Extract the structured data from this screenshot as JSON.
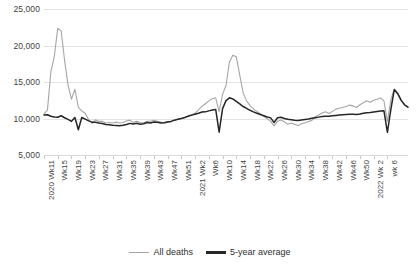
{
  "chart_data": {
    "type": "line",
    "title": "",
    "xlabel": "",
    "ylabel": "",
    "ylim": [
      5000,
      25000
    ],
    "y_ticks": [
      5000,
      10000,
      15000,
      20000,
      25000
    ],
    "y_tick_labels": [
      "5,000",
      "10,000",
      "15,000",
      "20,000",
      "25,000"
    ],
    "grid": true,
    "legend_position": "bottom-center",
    "legend": [
      "All deaths",
      "5-year average"
    ],
    "colors": {
      "all_deaths": "#a6a6a6",
      "five_year_average": "#262626",
      "gridline": "#e4e4e4"
    },
    "x_tick_labels": [
      "2020 Wk11",
      "Wk15",
      "Wk19",
      "Wk23",
      "Wk27",
      "Wk31",
      "Wk35",
      "Wk39",
      "Wk43",
      "Wk47",
      "Wk51",
      "2021 Wk2",
      "Wk6",
      "Wk10",
      "Wk14",
      "Wk18",
      "Wk22",
      "Wk26",
      "Wk30",
      "Wk34",
      "Wk38",
      "Wk42",
      "Wk46",
      "Wk50",
      "2022 Wk 2",
      "wk 6"
    ],
    "x_tick_every": 4,
    "series": [
      {
        "name": "All deaths",
        "values": [
          10645,
          11141,
          16387,
          18516,
          22351,
          21997,
          17953,
          14573,
          12657,
          14014,
          11539,
          11037,
          10709,
          9824,
          9339,
          9824,
          9602,
          9631,
          9392,
          9451,
          9392,
          9500,
          9392,
          9459,
          9655,
          9780,
          9451,
          9631,
          9451,
          9392,
          9631,
          9631,
          9772,
          9631,
          9514,
          9392,
          9574,
          9574,
          9788,
          9902,
          10012,
          10139,
          10389,
          10552,
          10718,
          11194,
          11683,
          12020,
          12416,
          12717,
          12832,
          10942,
          13300,
          14520,
          17751,
          18676,
          18447,
          15948,
          13508,
          12417,
          11765,
          11311,
          10982,
          10638,
          10290,
          9951,
          9610,
          8995,
          9612,
          9803,
          9542,
          9220,
          9372,
          9195,
          9046,
          9274,
          9410,
          9581,
          9744,
          10250,
          10490,
          10742,
          10920,
          10686,
          10978,
          11281,
          11406,
          11512,
          11641,
          11836,
          11729,
          11509,
          11887,
          12159,
          12437,
          12222,
          12493,
          12650,
          12828,
          12414,
          9600,
          12550,
          14057,
          13540,
          12554,
          11870,
          11480
        ]
      },
      {
        "name": "5-year average",
        "values": [
          10465,
          10520,
          10305,
          10195,
          10173,
          10380,
          10101,
          9884,
          9608,
          10145,
          8460,
          10132,
          9905,
          9672,
          9501,
          9474,
          9380,
          9320,
          9188,
          9135,
          9079,
          9049,
          9020,
          9061,
          9186,
          9332,
          9236,
          9353,
          9222,
          9284,
          9450,
          9394,
          9528,
          9492,
          9392,
          9411,
          9530,
          9601,
          9773,
          9893,
          10003,
          10131,
          10319,
          10462,
          10592,
          10716,
          10896,
          10908,
          11046,
          11156,
          11247,
          8123,
          11350,
          12442,
          12836,
          12674,
          12348,
          11996,
          11640,
          11383,
          11123,
          10913,
          10723,
          10538,
          10377,
          10200,
          10086,
          9462,
          10094,
          10170,
          10010,
          9902,
          9841,
          9767,
          9714,
          9794,
          9866,
          9924,
          10020,
          10106,
          10189,
          10263,
          10304,
          10321,
          10374,
          10425,
          10469,
          10498,
          10535,
          10571,
          10578,
          10556,
          10623,
          10713,
          10795,
          10830,
          10899,
          10968,
          11034,
          11049,
          8112,
          11220,
          13946,
          13400,
          12480,
          11880,
          11560
        ]
      }
    ]
  },
  "source_note": ""
}
